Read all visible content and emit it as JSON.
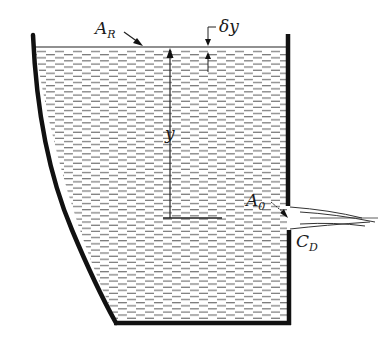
{
  "figure": {
    "type": "tank-draining-diagram",
    "labels": {
      "reservoir_area": {
        "main": "A",
        "sub": "R"
      },
      "height_increment": "δy",
      "height": "y",
      "orifice_area": {
        "main": "A",
        "sub": "0"
      },
      "discharge_coefficient": {
        "main": "C",
        "sub": "D"
      }
    },
    "colors": {
      "wall": "#111111",
      "water_hatch": "#555555",
      "background": "#ffffff"
    }
  }
}
